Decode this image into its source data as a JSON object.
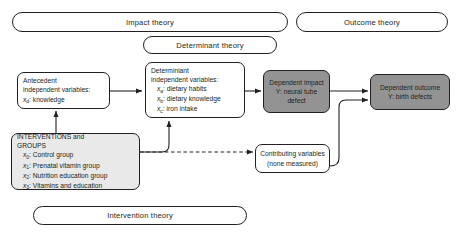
{
  "diagram": {
    "bubbles": {
      "impact": "Impact theory",
      "outcome": "Outcome theory",
      "determinant": "Determinant theory",
      "intervention": "Intervention theory"
    },
    "nodes": {
      "antecedent": {
        "l1": "Antecedent",
        "l2": "independent variables:",
        "l3_var": "x",
        "l3_sub": "d",
        "l3_rest": ": knowledge"
      },
      "determiniant": {
        "l1": "Determiniant",
        "l2": "independent variables:",
        "items": [
          {
            "var": "x",
            "sub": "a",
            "rest": ": dietary habits"
          },
          {
            "var": "x",
            "sub": "b",
            "rest": ": dietary knowledge"
          },
          {
            "var": "x",
            "sub": "c",
            "rest": ": iron intake"
          }
        ]
      },
      "interventions": {
        "l1": "INTERVENTIONS and",
        "l2": "GROUPS",
        "items": [
          {
            "var": "x",
            "sub": "0",
            "rest": ": Control group"
          },
          {
            "var": "x",
            "sub": "1",
            "rest": ": Prenatal vitamin group"
          },
          {
            "var": "x",
            "sub": "2",
            "rest": ": Nutrition education group"
          },
          {
            "var": "x",
            "sub": "3",
            "rest": ": Vitamins and education"
          }
        ]
      },
      "dependent_impact": {
        "l1": "Dependent impact",
        "l2": "Y: neural tube",
        "l3": "defect"
      },
      "dependent_outcome": {
        "l1": "Dependent outcome",
        "l2": "Y: birth defects"
      },
      "contributing": {
        "l1": "Contributing variables",
        "l2": "(none measured)"
      }
    },
    "colors": {
      "stroke": "#231f20",
      "dark_fill": "#939393",
      "light_fill": "#e9e9e9",
      "white_fill": "#ffffff"
    },
    "edges": [
      {
        "from": "antecedent",
        "to": "determiniant",
        "style": "solid"
      },
      {
        "from": "interventions",
        "to": "antecedent",
        "style": "solid"
      },
      {
        "from": "interventions",
        "to": "determiniant",
        "style": "solid"
      },
      {
        "from": "interventions",
        "to": "contributing",
        "style": "dashed"
      },
      {
        "from": "determiniant",
        "to": "dependent_impact",
        "style": "solid"
      },
      {
        "from": "dependent_impact",
        "to": "dependent_outcome",
        "style": "solid"
      },
      {
        "from": "contributing",
        "to": "dependent_outcome",
        "style": "solid"
      }
    ]
  }
}
